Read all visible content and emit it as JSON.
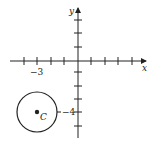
{
  "diagram": {
    "axes": {
      "x_label": "x",
      "y_label": "y",
      "x_tick_label": "−3",
      "y_tick_label": "−4"
    },
    "circle": {
      "center_label": "C",
      "center": [
        -3,
        -4
      ]
    },
    "colors": {
      "stroke": "#222222",
      "background": "#ffffff"
    }
  }
}
